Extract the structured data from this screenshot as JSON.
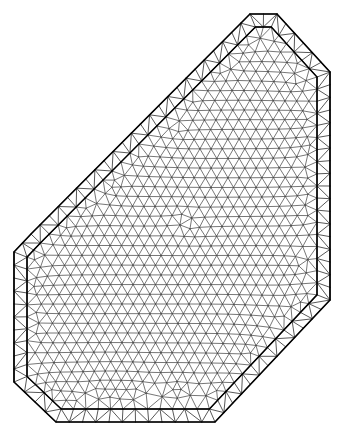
{
  "figure": {
    "type": "finite-element-mesh",
    "title": "",
    "caption": "",
    "background_color": "#ffffff",
    "canvas": {
      "width": 346,
      "height": 440
    }
  },
  "style": {
    "interior_edge_color": "#4a4a4a",
    "boundary_layer_edge_color": "#3a3a3a",
    "outer_boundary_color": "#000000",
    "inner_boundary_color": "#000000",
    "interior_edge_width": 0.75,
    "boundary_layer_edge_width": 0.85,
    "outer_boundary_width": 1.7,
    "inner_boundary_width": 1.5
  },
  "mesh": {
    "name": "polygonal-domain-triangulation",
    "element_type": "triangle",
    "boundary_layer_bands": 1,
    "boundary_layer_thickness_px": 13,
    "boundary_layer_segment_px": 13,
    "interior_target_edge_px": 11.2,
    "interior_relax_iterations": 26,
    "random_seed": 20240517,
    "domain_polygon": [
      [
        250,
        14
      ],
      [
        277,
        14
      ],
      [
        330,
        72
      ],
      [
        330,
        300
      ],
      [
        215,
        422
      ],
      [
        56,
        422
      ],
      [
        14,
        382
      ],
      [
        14,
        252
      ],
      [
        31,
        234
      ]
    ]
  }
}
